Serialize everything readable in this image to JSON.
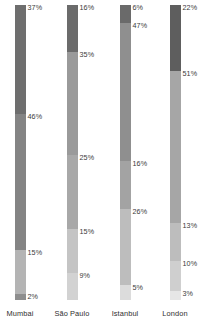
{
  "chart_data": {
    "type": "bar",
    "subtype": "stacked-percentage",
    "title": "",
    "xlabel": "",
    "ylabel": "",
    "ylim": [
      0,
      100
    ],
    "grid": false,
    "legend": "none",
    "orientation": "vertical",
    "stack_order": "top-to-bottom",
    "value_suffix": "%",
    "categories": [
      "Mumbai",
      "São Paulo",
      "Istanbul",
      "London"
    ],
    "bars": [
      {
        "category": "Mumbai",
        "segments": [
          {
            "label": "37%",
            "value": 37,
            "color": "#6e6e6e"
          },
          {
            "label": "46%",
            "value": 46,
            "color": "#848484"
          },
          {
            "label": "15%",
            "value": 15,
            "color": "#b4b4b4"
          },
          {
            "label": "2%",
            "value": 2,
            "color": "#8e8e8e"
          }
        ]
      },
      {
        "category": "São Paulo",
        "segments": [
          {
            "label": "16%",
            "value": 16,
            "color": "#6b6b6b"
          },
          {
            "label": "35%",
            "value": 35,
            "color": "#9a9a9a"
          },
          {
            "label": "25%",
            "value": 25,
            "color": "#a8a8a8"
          },
          {
            "label": "15%",
            "value": 15,
            "color": "#c4c4c4"
          },
          {
            "label": "9%",
            "value": 9,
            "color": "#d2d2d2"
          }
        ]
      },
      {
        "category": "Istanbul",
        "segments": [
          {
            "label": "6%",
            "value": 6,
            "color": "#6a6a6a"
          },
          {
            "label": "47%",
            "value": 47,
            "color": "#8f8f8f"
          },
          {
            "label": "16%",
            "value": 16,
            "color": "#a3a3a3"
          },
          {
            "label": "26%",
            "value": 26,
            "color": "#bdbdbd"
          },
          {
            "label": "5%",
            "value": 5,
            "color": "#dcdcdc"
          }
        ]
      },
      {
        "category": "London",
        "segments": [
          {
            "label": "22%",
            "value": 22,
            "color": "#5e5e5e"
          },
          {
            "label": "51%",
            "value": 51,
            "color": "#a6a6a6"
          },
          {
            "label": "13%",
            "value": 13,
            "color": "#bdbdbd"
          },
          {
            "label": "10%",
            "value": 10,
            "color": "#cfcfcf"
          },
          {
            "label": "3%",
            "value": 3,
            "color": "#e6e6e6"
          }
        ]
      }
    ]
  },
  "layout": {
    "bar_centers": [
      20,
      72,
      125,
      175
    ],
    "bar_width": 11,
    "plot_top": 5,
    "plot_height": 295,
    "label_baseline": 309
  },
  "colors": {
    "background": "#ffffff",
    "text": "#2e2e2e",
    "value_text": "#3a3a3a"
  }
}
